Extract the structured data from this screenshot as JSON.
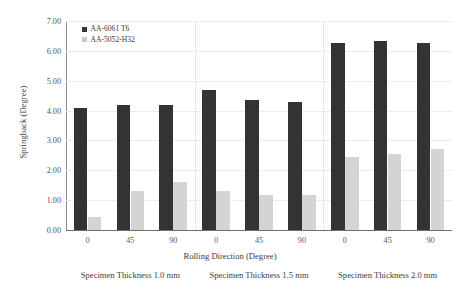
{
  "chart_data": {
    "type": "bar",
    "title": "",
    "xlabel": "Rolling Direction (Degree)",
    "ylabel": "Springback (Degree)",
    "ylim": [
      0,
      7
    ],
    "ytick_labels": [
      "0.00",
      "1.00",
      "2.00",
      "3.00",
      "4.00",
      "5.00",
      "6.00",
      "7.00"
    ],
    "ytick_values": [
      0,
      1,
      2,
      3,
      4,
      5,
      6,
      7
    ],
    "grid": true,
    "legend_position": "top-left",
    "categories": [
      "0",
      "45",
      "90",
      "0",
      "45",
      "90",
      "0",
      "45",
      "90"
    ],
    "groups": [
      {
        "label": "Specimen Thickness 1.0 mm",
        "categories": [
          "0",
          "45",
          "90"
        ],
        "series": [
          {
            "name": "AA-6061 T6",
            "values": [
              4.1,
              4.2,
              4.18
            ]
          },
          {
            "name": "AA-5052-H32",
            "values": [
              0.42,
              1.32,
              1.62
            ]
          }
        ]
      },
      {
        "label": "Specimen Thickness 1.5 mm",
        "categories": [
          "0",
          "45",
          "90"
        ],
        "series": [
          {
            "name": "AA-6061 T6",
            "values": [
              4.7,
              4.35,
              4.28
            ]
          },
          {
            "name": "AA-5052-H32",
            "values": [
              1.3,
              1.18,
              1.18
            ]
          }
        ]
      },
      {
        "label": "Specimen Thickness 2.0 mm",
        "categories": [
          "0",
          "45",
          "90"
        ],
        "series": [
          {
            "name": "AA-6061 T6",
            "values": [
              6.25,
              6.32,
              6.25
            ]
          },
          {
            "name": "AA-5052-H32",
            "values": [
              2.45,
              2.55,
              2.72
            ]
          }
        ]
      }
    ],
    "series": [
      {
        "name": "AA-6061 T6",
        "color": "#333333",
        "values": [
          4.1,
          4.2,
          4.18,
          4.7,
          4.35,
          4.28,
          6.25,
          6.32,
          6.25
        ]
      },
      {
        "name": "AA-5052-H32",
        "color": "#d4d4d4",
        "values": [
          0.42,
          1.32,
          1.62,
          1.3,
          1.18,
          1.18,
          2.45,
          2.55,
          2.72
        ]
      }
    ]
  },
  "legend": {
    "entries": [
      {
        "label": "AA-6061 T6"
      },
      {
        "label": "AA-5052-H32"
      }
    ]
  },
  "colors": {
    "series_0": "#333333",
    "series_1": "#d4d4d4",
    "axis": "#6e6e6e",
    "grid": "#ededed",
    "text": "#3d3d3d"
  }
}
